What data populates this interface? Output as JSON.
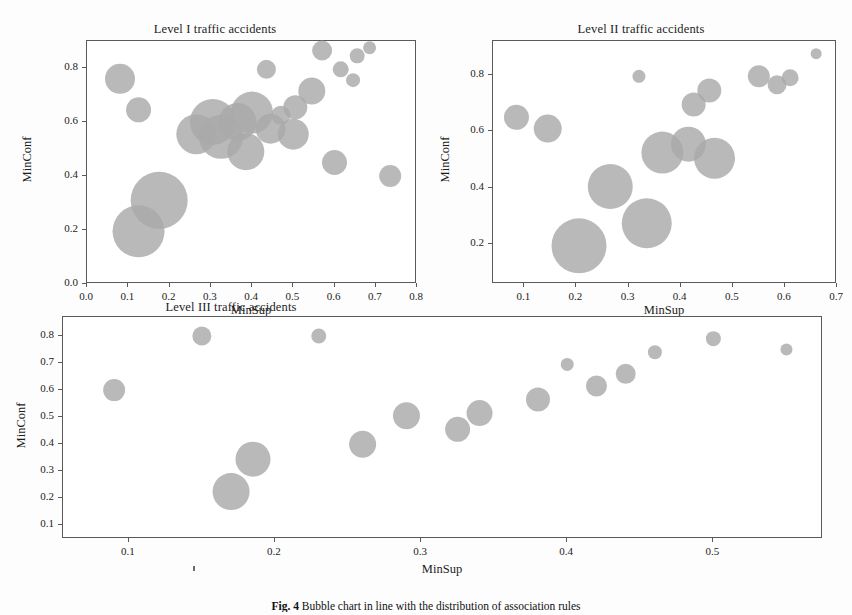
{
  "figure": {
    "caption_label": "Fig. 4",
    "caption_text": "Bubble chart in line with the distribution of association rules",
    "bubble_color": "#a9a9a9",
    "frame_color": "#5a5a5a",
    "background": "#ffffff"
  },
  "panels": [
    {
      "id": "level-1",
      "title": "Level I traffic accidents",
      "xlabel": "MinSup",
      "ylabel": "MinConf",
      "xticks": [
        "0.0",
        "0.1",
        "0.2",
        "0.3",
        "0.4",
        "0.5",
        "0.6",
        "0.7",
        "0.8"
      ],
      "yticks": [
        "0.0",
        "0.2",
        "0.4",
        "0.6",
        "0.8"
      ],
      "xlim": [
        0.0,
        0.8
      ],
      "ylim": [
        0.0,
        0.9
      ]
    },
    {
      "id": "level-2",
      "title": "Level II traffic accidents",
      "xlabel": "MinSup",
      "ylabel": "MinConf",
      "xticks": [
        "0.1",
        "0.2",
        "0.3",
        "0.4",
        "0.5",
        "0.6",
        "0.7"
      ],
      "yticks": [
        "0.2",
        "0.4",
        "0.6",
        "0.8"
      ],
      "xlim": [
        0.04,
        0.7
      ],
      "ylim": [
        0.06,
        0.92
      ]
    },
    {
      "id": "level-3",
      "title": "Level III traffic accidents",
      "xlabel": "MinSup",
      "ylabel": "MinConf",
      "xticks": [
        "0.1",
        "0.2",
        "0.3",
        "0.4",
        "0.5"
      ],
      "yticks": [
        "0.1",
        "0.2",
        "0.3",
        "0.4",
        "0.5",
        "0.6",
        "0.7",
        "0.8"
      ],
      "xlim": [
        0.055,
        0.575
      ],
      "ylim": [
        0.05,
        0.87
      ]
    }
  ],
  "chart_data": [
    {
      "type": "scatter",
      "id": "level-1",
      "title": "Level I traffic accidents",
      "xlabel": "MinSup",
      "ylabel": "MinConf",
      "xlim": [
        0.0,
        0.8
      ],
      "ylim": [
        0.0,
        0.9
      ],
      "grid": false,
      "legend": null,
      "bubble_encoding": "marker area encodes number of association rules",
      "points": [
        {
          "x": 0.08,
          "y": 0.76,
          "size": 30
        },
        {
          "x": 0.125,
          "y": 0.645,
          "size": 25
        },
        {
          "x": 0.125,
          "y": 0.195,
          "size": 52
        },
        {
          "x": 0.175,
          "y": 0.31,
          "size": 57
        },
        {
          "x": 0.265,
          "y": 0.555,
          "size": 40
        },
        {
          "x": 0.305,
          "y": 0.6,
          "size": 46
        },
        {
          "x": 0.325,
          "y": 0.545,
          "size": 44
        },
        {
          "x": 0.365,
          "y": 0.6,
          "size": 38
        },
        {
          "x": 0.385,
          "y": 0.49,
          "size": 37
        },
        {
          "x": 0.4,
          "y": 0.635,
          "size": 42
        },
        {
          "x": 0.435,
          "y": 0.795,
          "size": 19
        },
        {
          "x": 0.445,
          "y": 0.575,
          "size": 30
        },
        {
          "x": 0.47,
          "y": 0.625,
          "size": 19
        },
        {
          "x": 0.5,
          "y": 0.555,
          "size": 31
        },
        {
          "x": 0.505,
          "y": 0.655,
          "size": 24
        },
        {
          "x": 0.545,
          "y": 0.715,
          "size": 27
        },
        {
          "x": 0.57,
          "y": 0.865,
          "size": 20
        },
        {
          "x": 0.6,
          "y": 0.45,
          "size": 25
        },
        {
          "x": 0.615,
          "y": 0.795,
          "size": 16
        },
        {
          "x": 0.645,
          "y": 0.755,
          "size": 14
        },
        {
          "x": 0.655,
          "y": 0.845,
          "size": 15
        },
        {
          "x": 0.685,
          "y": 0.875,
          "size": 13
        },
        {
          "x": 0.735,
          "y": 0.4,
          "size": 22
        }
      ]
    },
    {
      "type": "scatter",
      "id": "level-2",
      "title": "Level II traffic accidents",
      "xlabel": "MinSup",
      "ylabel": "MinConf",
      "xlim": [
        0.04,
        0.7
      ],
      "ylim": [
        0.06,
        0.92
      ],
      "grid": false,
      "legend": null,
      "bubble_encoding": "marker area encodes number of association rules",
      "points": [
        {
          "x": 0.085,
          "y": 0.65,
          "size": 25
        },
        {
          "x": 0.145,
          "y": 0.61,
          "size": 28
        },
        {
          "x": 0.205,
          "y": 0.195,
          "size": 55
        },
        {
          "x": 0.265,
          "y": 0.405,
          "size": 45
        },
        {
          "x": 0.32,
          "y": 0.795,
          "size": 13
        },
        {
          "x": 0.335,
          "y": 0.275,
          "size": 50
        },
        {
          "x": 0.365,
          "y": 0.525,
          "size": 42
        },
        {
          "x": 0.415,
          "y": 0.555,
          "size": 35
        },
        {
          "x": 0.425,
          "y": 0.695,
          "size": 24
        },
        {
          "x": 0.455,
          "y": 0.745,
          "size": 24
        },
        {
          "x": 0.465,
          "y": 0.505,
          "size": 41
        },
        {
          "x": 0.55,
          "y": 0.795,
          "size": 22
        },
        {
          "x": 0.585,
          "y": 0.765,
          "size": 19
        },
        {
          "x": 0.61,
          "y": 0.79,
          "size": 17
        },
        {
          "x": 0.66,
          "y": 0.875,
          "size": 11
        }
      ]
    },
    {
      "type": "scatter",
      "id": "level-3",
      "title": "Level III traffic accidents",
      "xlabel": "MinSup",
      "ylabel": "MinConf",
      "xlim": [
        0.055,
        0.575
      ],
      "ylim": [
        0.05,
        0.87
      ],
      "grid": false,
      "legend": null,
      "bubble_encoding": "marker area encodes number of association rules",
      "points": [
        {
          "x": 0.09,
          "y": 0.6,
          "size": 22
        },
        {
          "x": 0.15,
          "y": 0.8,
          "size": 19
        },
        {
          "x": 0.17,
          "y": 0.225,
          "size": 37
        },
        {
          "x": 0.185,
          "y": 0.345,
          "size": 35
        },
        {
          "x": 0.23,
          "y": 0.8,
          "size": 15
        },
        {
          "x": 0.26,
          "y": 0.4,
          "size": 27
        },
        {
          "x": 0.29,
          "y": 0.505,
          "size": 27
        },
        {
          "x": 0.325,
          "y": 0.455,
          "size": 25
        },
        {
          "x": 0.34,
          "y": 0.515,
          "size": 26
        },
        {
          "x": 0.38,
          "y": 0.565,
          "size": 24
        },
        {
          "x": 0.4,
          "y": 0.695,
          "size": 13
        },
        {
          "x": 0.42,
          "y": 0.615,
          "size": 21
        },
        {
          "x": 0.44,
          "y": 0.66,
          "size": 20
        },
        {
          "x": 0.46,
          "y": 0.74,
          "size": 14
        },
        {
          "x": 0.5,
          "y": 0.79,
          "size": 15
        },
        {
          "x": 0.55,
          "y": 0.75,
          "size": 12
        }
      ]
    }
  ]
}
